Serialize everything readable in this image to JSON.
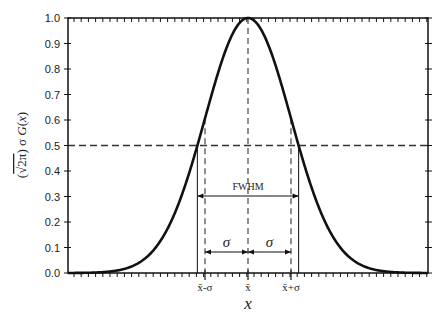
{
  "chart_data": {
    "type": "line",
    "title": "",
    "xlabel": "x",
    "ylabel": "(√2π) σ G(x)",
    "ylim": [
      0.0,
      1.0
    ],
    "yticks": [
      "0.0",
      "0.1",
      "0.2",
      "0.3",
      "0.4",
      "0.5",
      "0.6",
      "0.7",
      "0.8",
      "0.9",
      "1.0"
    ],
    "xtick_labels": [
      "x̄-σ",
      "x̄",
      "x̄+σ"
    ],
    "grid": false,
    "legend": null,
    "series": [
      {
        "name": "Gaussian",
        "x_in_sigma": [
          -4.5,
          -4,
          -3,
          -2.5,
          -2,
          -1.5,
          -1,
          -0.5,
          0,
          0.5,
          1,
          1.5,
          2,
          2.5,
          3,
          4,
          4.5
        ],
        "values": [
          0.0,
          0.0003,
          0.011,
          0.044,
          0.135,
          0.325,
          0.607,
          0.882,
          1.0,
          0.882,
          0.607,
          0.325,
          0.135,
          0.044,
          0.011,
          0.0003,
          0.0
        ]
      }
    ],
    "annotations": {
      "half_max_line": 0.5,
      "fwhm_label": "FWHM",
      "sigma_label": "σ",
      "fwhm_half_width_sigma": 1.1774
    }
  }
}
